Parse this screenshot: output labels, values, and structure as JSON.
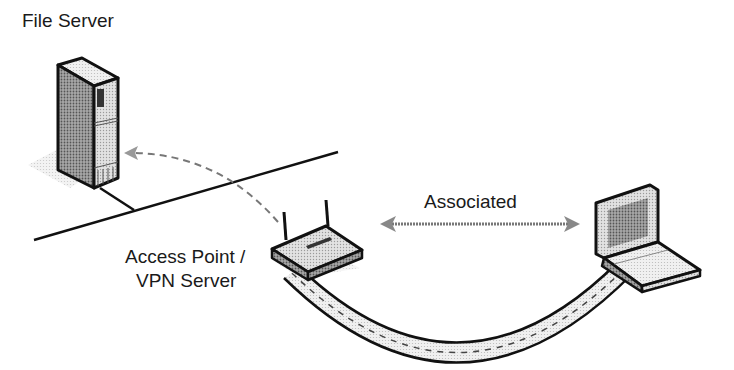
{
  "diagram": {
    "nodes": {
      "file_server": {
        "label": "File Server"
      },
      "access_point": {
        "label_line1": "Access Point /",
        "label_line2": "VPN Server"
      },
      "laptop": {
        "label": ""
      }
    },
    "links": {
      "association": {
        "label": "Associated"
      }
    },
    "colors": {
      "ink": "#111111",
      "device_fill": "#d9d9d9",
      "device_dark": "#8c8c8c",
      "tunnel_fill": "#e6e6e6",
      "shadow": "#cfcfcf"
    }
  }
}
